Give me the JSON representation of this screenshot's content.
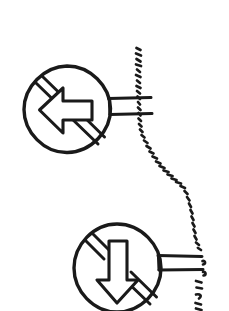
{
  "image": {
    "kind": "hand-drawn-sketch",
    "title": "Two crossed-out direction arrow signs joined by a dashed path",
    "width": 229,
    "height": 311,
    "background_color": "#ffffff",
    "ink_color": "#1a1a1a"
  },
  "signs": [
    {
      "id": "sign-no-left",
      "label": "no-left-arrow-sign",
      "meaning": "left arrow crossed out",
      "arrow_direction": "left",
      "center_x": 67,
      "center_y": 109,
      "radius": 43,
      "stroke_width": 3.2,
      "slash": {
        "present": true,
        "orientation": "diagonal-band",
        "from_x": 37,
        "from_y": 79,
        "to_x": 98,
        "to_y": 141,
        "band_width": 9
      },
      "connector": {
        "present": true,
        "style": "double-line-bracket",
        "line_count": 2,
        "from_x": 108,
        "to_x": 152,
        "top_y": 98,
        "bottom_y": 114
      }
    },
    {
      "id": "sign-no-down",
      "label": "no-down-arrow-sign",
      "meaning": "down arrow crossed out",
      "arrow_direction": "down",
      "center_x": 117,
      "center_y": 268,
      "radius": 44,
      "stroke_width": 3.2,
      "slash": {
        "present": true,
        "orientation": "diagonal-band",
        "from_x": 86,
        "from_y": 238,
        "to_x": 149,
        "to_y": 300,
        "band_width": 9
      },
      "connector": {
        "present": true,
        "style": "double-line-bracket",
        "line_count": 2,
        "from_x": 158,
        "to_x": 203,
        "top_y": 256,
        "bottom_y": 270
      }
    }
  ],
  "dashed_path": {
    "id": "dashed-connector-path",
    "label": "sketchy dashed curve linking the two signs",
    "style": "hand-drawn-dashes",
    "stroke_width": 2.6,
    "segments": [
      {
        "name": "upper-vertical",
        "x1": 138,
        "y1": 48,
        "x2": 140,
        "y2": 130
      },
      {
        "name": "middle-diagonal",
        "x1": 140,
        "y1": 130,
        "x2": 190,
        "y2": 200
      },
      {
        "name": "lower-vertical",
        "x1": 190,
        "y1": 200,
        "x2": 199,
        "y2": 311
      }
    ],
    "dash_count": 46
  },
  "arrows": {
    "left_arrow": {
      "name": "left-pointing-arrow",
      "tip_x": 40,
      "tip_y": 110,
      "tail_x": 92,
      "tail_y": 110,
      "head_half_height": 18,
      "shaft_half_height": 7
    },
    "down_arrow": {
      "name": "down-pointing-arrow",
      "tip_x": 117,
      "tip_y": 302,
      "tail_x": 117,
      "tail_y": 240,
      "head_half_width": 17,
      "shaft_half_width": 7
    }
  }
}
